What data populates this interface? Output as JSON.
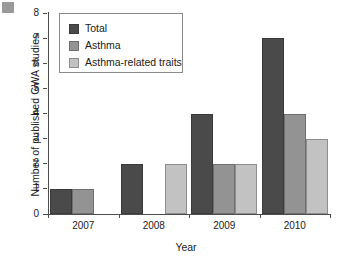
{
  "chart_data": {
    "type": "bar",
    "title": "",
    "xlabel": "Year",
    "ylabel": "Number of published GWA studies",
    "categories": [
      "2007",
      "2008",
      "2009",
      "2010"
    ],
    "series": [
      {
        "name": "Total",
        "color": "#4a4a4a",
        "values": [
          1,
          2,
          4,
          7
        ]
      },
      {
        "name": "Asthma",
        "color": "#939393",
        "values": [
          1,
          0,
          2,
          4
        ]
      },
      {
        "name": "Asthma-related traits",
        "color": "#c2c2c2",
        "values": [
          0,
          2,
          2,
          3
        ]
      }
    ],
    "ylim": [
      0,
      8
    ],
    "yticks": [
      0,
      1,
      2,
      3,
      4,
      5,
      6,
      7,
      8
    ],
    "grid": false,
    "legend_position": "top-left"
  }
}
